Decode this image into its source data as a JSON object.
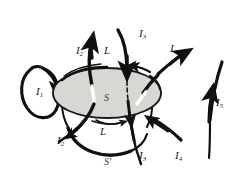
{
  "figure": {
    "background_color": "#ffffff",
    "ink_color": "#111111",
    "disk_fill_color": "#d9d7d2",
    "disk_edge_color": "#1a1a1a",
    "labels": {
      "current_1": "I",
      "current_1_sub": "1",
      "current_2_top": "I",
      "current_2_top_sub": "2",
      "current_3_top": "I",
      "current_3_top_sub": "3",
      "current_4_top": "I",
      "current_4_top_sub": "4",
      "current_5_right": "I",
      "current_5_right_sub": "5",
      "current_2_bottom": "I",
      "current_2_bottom_sub": "2",
      "current_3_bottom": "I",
      "current_3_bottom_sub": "3",
      "current_4_bottom": "I",
      "current_4_bottom_sub": "4",
      "contour_L_top": "L",
      "contour_L_bottom": "L",
      "surface_S": "S",
      "surface_S_prime": "S'"
    }
  }
}
